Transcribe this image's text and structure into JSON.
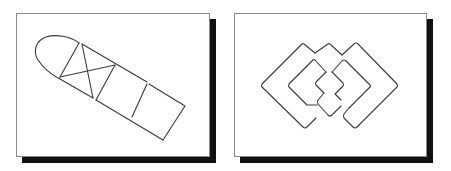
{
  "figure": {
    "panels": [
      {
        "id": "left",
        "description": "Elongated bullet-shaped outline divided into segments, with a crossed (X) box and a square end",
        "frame": {
          "x": 16,
          "y": 13,
          "w": 194,
          "h": 144
        },
        "shadow_offset": 6
      },
      {
        "id": "right",
        "description": "Interlocking rounded diamond (square-rotated) outlines forming a chain-like pattern",
        "frame": {
          "x": 234,
          "y": 13,
          "w": 193,
          "h": 144
        },
        "shadow_offset": 6
      }
    ],
    "colors": {
      "line": "#3a3a3a",
      "frame_border": "#8a8a8a",
      "shadow": "#111111",
      "background": "#ffffff"
    }
  }
}
